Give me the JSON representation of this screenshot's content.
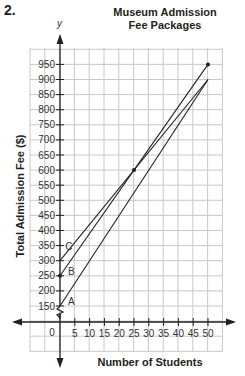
{
  "problem_number": "2.",
  "chart_data": {
    "type": "line",
    "title": "Museum Admission Fee Packages",
    "title_lines": [
      "Museum Admission",
      "Fee Packages"
    ],
    "xlabel": "Number of Students",
    "ylabel": "Total Admission Fee ($)",
    "y_axis_symbol": "y",
    "x_ticks": [
      0,
      5,
      10,
      15,
      20,
      25,
      30,
      35,
      40,
      45,
      50
    ],
    "y_ticks": [
      150,
      200,
      250,
      300,
      350,
      400,
      450,
      500,
      550,
      600,
      650,
      700,
      750,
      800,
      850,
      900,
      950
    ],
    "xlim": [
      0,
      50
    ],
    "ylim": [
      150,
      950
    ],
    "y_axis_break": true,
    "grid": true,
    "series": [
      {
        "name": "A",
        "x": [
          0,
          50
        ],
        "y": [
          150,
          900
        ]
      },
      {
        "name": "B",
        "x": [
          0,
          50
        ],
        "y": [
          250,
          950
        ]
      },
      {
        "name": "C",
        "x": [
          0,
          50
        ],
        "y": [
          300,
          900
        ]
      }
    ],
    "marked_points": [
      {
        "x": 0,
        "y": 250
      },
      {
        "x": 25,
        "y": 600
      },
      {
        "x": 50,
        "y": 950
      }
    ],
    "origin_label": "0"
  }
}
